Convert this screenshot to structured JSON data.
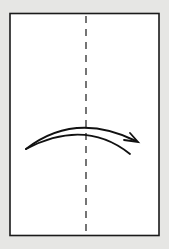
{
  "diagram": {
    "type": "origami-fold-step",
    "background_color": "#e6e6e4",
    "paper": {
      "shape": "rectangle",
      "fill": "#ffffff",
      "stroke": "#1a1a1a",
      "x": 9,
      "y": 13,
      "width": 151,
      "height": 223
    },
    "fold_line": {
      "style": "dashed",
      "orientation": "vertical",
      "label": "valley-fold-line",
      "x": 86,
      "y1": 16,
      "y2": 232
    },
    "arrow": {
      "label": "fold-direction-arrow",
      "direction": "left-to-right",
      "meaning": "fold left half over to the right"
    }
  }
}
